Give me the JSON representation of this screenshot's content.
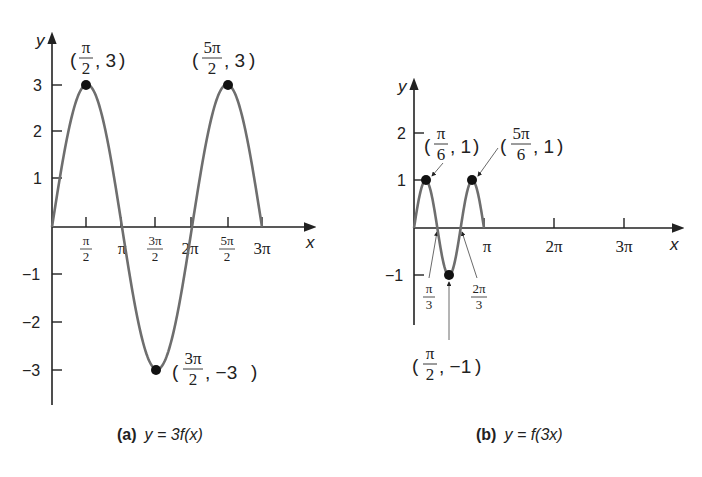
{
  "chart_data": [
    {
      "type": "line",
      "panel": "a",
      "caption_tag": "(a)",
      "caption_eq": "y = 3f(x)",
      "function": "y = 3 sin(x)",
      "xlabel": "x",
      "ylabel": "y",
      "x_range": [
        "0",
        "3π"
      ],
      "ylim": [
        -3,
        3
      ],
      "x_tick_labels": [
        "π/2",
        "π",
        "3π/2",
        "2π",
        "5π/2",
        "3π"
      ],
      "y_tick_labels": [
        "3",
        "2",
        "1",
        "−1",
        "−2",
        "−3"
      ],
      "highlighted_points": [
        {
          "x": "π/2",
          "y": 3,
          "label": "(π/2, 3)"
        },
        {
          "x": "5π/2",
          "y": 3,
          "label": "(5π/2, 3)"
        },
        {
          "x": "3π/2",
          "y": -3,
          "label": "(3π/2, −3)"
        }
      ],
      "x": [
        0,
        0.5,
        1,
        1.5,
        2,
        2.5,
        3
      ],
      "x_units": "π",
      "values": [
        0,
        3,
        0,
        -3,
        0,
        3,
        0
      ]
    },
    {
      "type": "line",
      "panel": "b",
      "caption_tag": "(b)",
      "caption_eq": "y = f(3x)",
      "function": "y = sin(3x)",
      "xlabel": "x",
      "ylabel": "y",
      "x_range": [
        "0",
        "π"
      ],
      "ylim": [
        -1,
        2
      ],
      "x_tick_labels": [
        "π/3",
        "2π/3",
        "π",
        "2π",
        "3π"
      ],
      "y_tick_labels": [
        "2",
        "1",
        "−1"
      ],
      "highlighted_points": [
        {
          "x": "π/6",
          "y": 1,
          "label": "(π/6, 1)"
        },
        {
          "x": "5π/6",
          "y": 1,
          "label": "(5π/6, 1)"
        },
        {
          "x": "π/2",
          "y": -1,
          "label": "(π/2, −1)"
        }
      ],
      "x": [
        0,
        0.1667,
        0.3333,
        0.5,
        0.6667,
        0.8333,
        1
      ],
      "x_units": "π",
      "values": [
        0,
        1,
        0,
        -1,
        0,
        1,
        0
      ]
    }
  ],
  "labels": {
    "a": {
      "y_axis": "y",
      "x_axis": "x",
      "y_ticks": [
        "3",
        "2",
        "1",
        "−1",
        "−2",
        "−3"
      ],
      "x_ticks": [
        {
          "num": "π",
          "den": "2"
        },
        {
          "text": "π"
        },
        {
          "num": "3π",
          "den": "2"
        },
        {
          "text": "2π"
        },
        {
          "num": "5π",
          "den": "2"
        },
        {
          "text": "3π"
        }
      ],
      "p1": {
        "num": "π",
        "den": "2",
        "rest": ", 3"
      },
      "p2": {
        "num": "5π",
        "den": "2",
        "rest": ", 3"
      },
      "p3": {
        "num": "3π",
        "den": "2",
        "rest": ", −3"
      },
      "caption_tag": "(a)",
      "caption_eq": "y = 3f(x)"
    },
    "b": {
      "y_axis": "y",
      "x_axis": "x",
      "y_ticks": [
        "2",
        "1",
        "−1"
      ],
      "x_ticks_small": [
        {
          "num": "π",
          "den": "3"
        },
        {
          "num": "2π",
          "den": "3"
        }
      ],
      "x_ticks": [
        "π",
        "2π",
        "3π"
      ],
      "p1": {
        "num": "π",
        "den": "6",
        "rest": ", 1"
      },
      "p2": {
        "num": "5π",
        "den": "6",
        "rest": ", 1"
      },
      "p3": {
        "num": "π",
        "den": "2",
        "rest": ", −1"
      },
      "caption_tag": "(b)",
      "caption_eq": "y = f(3x)"
    }
  },
  "colors": {
    "axis": "#222222",
    "curve": "#6e6e6e",
    "point": "#111111"
  }
}
